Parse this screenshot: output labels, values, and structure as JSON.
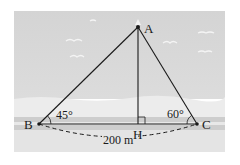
{
  "figure": {
    "points": {
      "A": {
        "label": "A",
        "x": 138,
        "y": 27
      },
      "B": {
        "label": "B",
        "x": 39,
        "y": 124
      },
      "C": {
        "label": "C",
        "x": 197,
        "y": 124
      },
      "H": {
        "label": "H",
        "x": 138,
        "y": 124
      }
    },
    "angles": {
      "B": "45°",
      "C": "60°"
    },
    "distance_label": "200 m",
    "colors": {
      "sky": "#d9d9d9",
      "beach": "#eeeeee",
      "road": "#cfcfcf",
      "ground": "#e6e6e6",
      "line": "#1a1a1a"
    }
  }
}
